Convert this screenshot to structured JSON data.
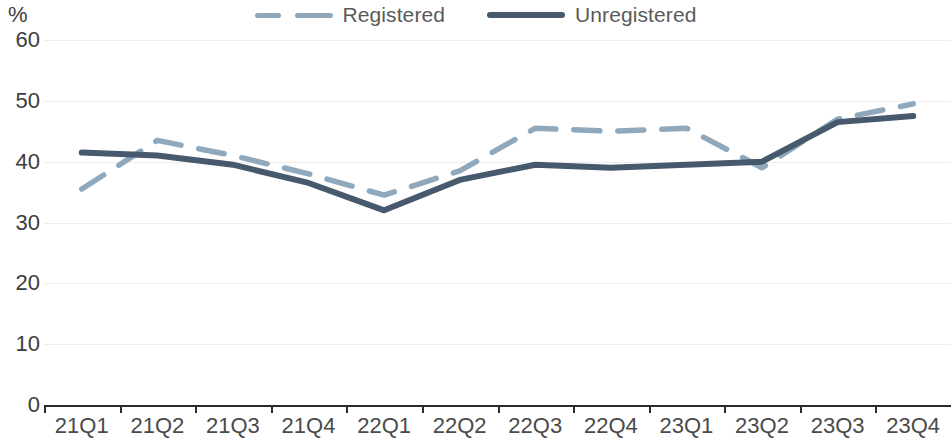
{
  "chart_data": {
    "type": "line",
    "title": "",
    "subtitle": "",
    "xlabel": "",
    "ylabel": "%",
    "ylim": [
      0,
      60
    ],
    "yticks": [
      0,
      10,
      20,
      30,
      40,
      50,
      60
    ],
    "grid": true,
    "legend_position": "top-center",
    "categories": [
      "21Q1",
      "21Q2",
      "21Q3",
      "21Q4",
      "22Q1",
      "22Q2",
      "22Q3",
      "22Q4",
      "23Q1",
      "23Q2",
      "23Q3",
      "23Q4"
    ],
    "series": [
      {
        "name": "Registered",
        "style": "dashed",
        "color": "#90a8bb",
        "values": [
          35.5,
          43.5,
          41.0,
          38.0,
          34.5,
          38.5,
          45.5,
          45.0,
          45.5,
          39.0,
          47.0,
          49.5
        ]
      },
      {
        "name": "Unregistered",
        "style": "solid",
        "color": "#47596c",
        "values": [
          41.5,
          41.0,
          39.5,
          36.5,
          32.0,
          37.0,
          39.5,
          39.0,
          39.5,
          40.0,
          46.5,
          47.5
        ]
      }
    ]
  },
  "axis": {
    "unit_label": "%",
    "y_tick_labels": [
      "60",
      "50",
      "40",
      "30",
      "20",
      "10",
      "0"
    ],
    "x_tick_labels": [
      "21Q1",
      "21Q2",
      "21Q3",
      "21Q4",
      "22Q1",
      "22Q2",
      "22Q3",
      "22Q4",
      "23Q1",
      "23Q2",
      "23Q3",
      "23Q4"
    ]
  },
  "legend": {
    "items": [
      {
        "label": "Registered",
        "color": "#90a8bb",
        "style": "dashed"
      },
      {
        "label": "Unregistered",
        "color": "#47596c",
        "style": "solid"
      }
    ]
  }
}
